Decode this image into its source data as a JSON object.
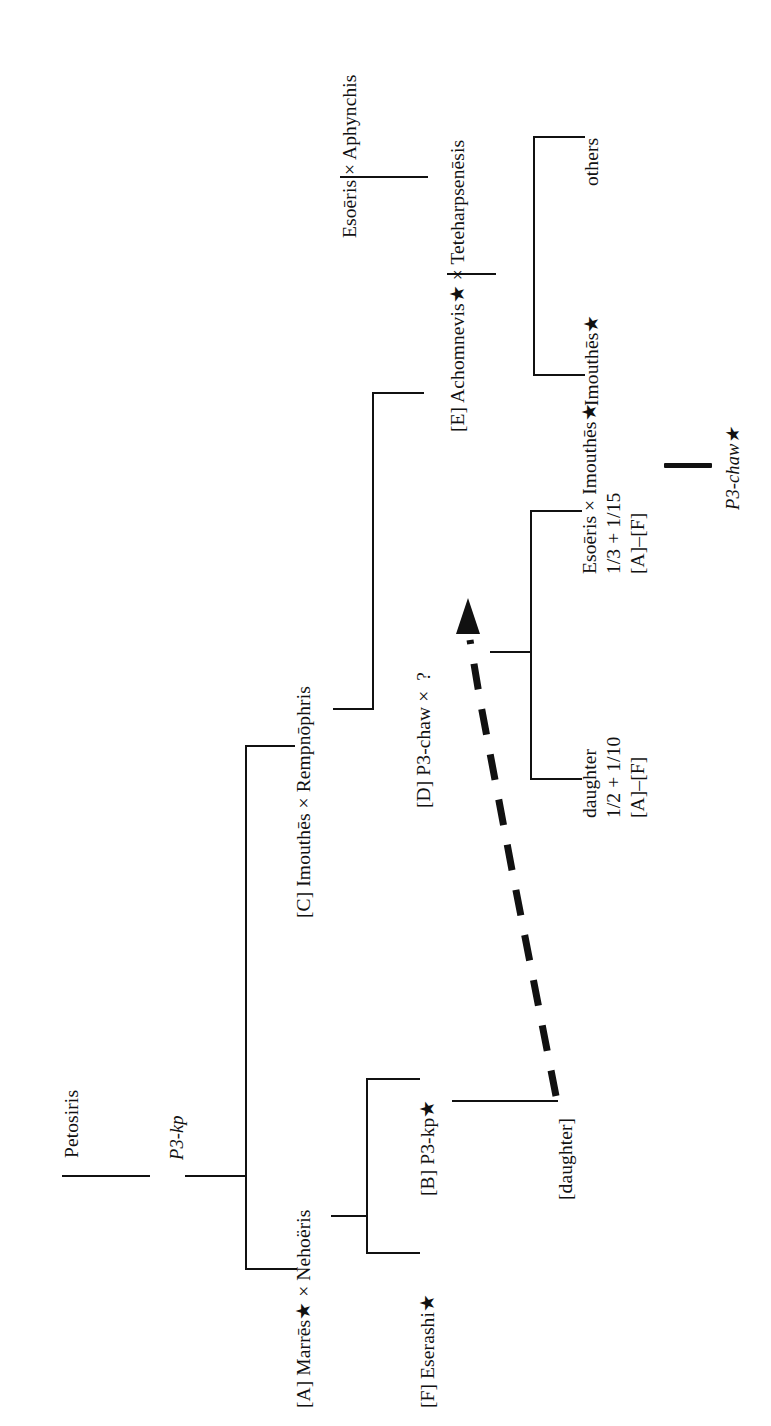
{
  "diagram": {
    "type": "genealogical-family-tree",
    "orientation": "rotated-90-counterclockwise",
    "symbols": {
      "marriage": "×",
      "asterisk_marker": "★",
      "unknown": "?"
    },
    "nodes": {
      "petosiris": "Petosiris",
      "p3kp_patronym": "P3-kp",
      "marres_nehoeris": "[A] Marrēs★ × Nehoëris",
      "eserashi": "[F] Eserashi★",
      "p3kp_b": "[B] P3-kp★",
      "daughter_bracket": "[daughter]",
      "imouthes_rempnophris": "[C] Imouthēs × Rempnōphris",
      "p3chaw_d": "[D] P3-chaw",
      "p3chaw_d_marriage": "×",
      "p3chaw_d_spouse": "?",
      "daughter_share_name": "daughter",
      "daughter_share_fraction": "1/2 + 1/10",
      "daughter_share_range": "[A]–[F]",
      "esoeris_imouthes": "Esoēris × Imouthēs★",
      "esoeris_imouthes_fraction": "1/3 + 1/15",
      "esoeris_imouthes_range": "[A]–[F]",
      "p3chaw_star": "P3-chaw★",
      "achomnevis_teteharpsenesis": "[E] Achomnevis★ × Teteharpsenēsis",
      "esoeris_aphynchis": "Esoēris × Aphynchis",
      "imouthes_star": "Imouthēs★",
      "others": "others"
    },
    "colors": {
      "ink": "#111111",
      "paper": "#ffffff"
    }
  }
}
